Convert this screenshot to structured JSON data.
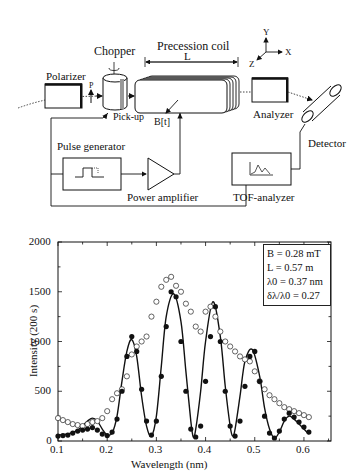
{
  "diagram": {
    "labels": {
      "polarizer": "Polarizer",
      "chopper": "Chopper",
      "precession_coil": "Precession coil",
      "length_L": "L",
      "p_label": "P",
      "pickup": "Pick-up",
      "field": "B[t]",
      "analyzer": "Analyzer",
      "detector": "Detector",
      "pulse_generator": "Pulse generator",
      "power_amplifier": "Power amplifier",
      "tof_analyzer": "TOF-analyzer",
      "axis_y": "Y",
      "axis_x": "X",
      "axis_z": "Z"
    }
  },
  "chart_data": {
    "type": "scatter",
    "title": "",
    "xlabel": "Wavelength (nm)",
    "ylabel": "Intensity (200 s)",
    "xlim": [
      0.1,
      0.655
    ],
    "ylim": [
      0,
      2000
    ],
    "xticks": [
      "0.1",
      "0.2",
      "0.3",
      "0.4",
      "0.5",
      "0.6"
    ],
    "yticks": [
      "0",
      "500",
      "1000",
      "1500",
      "2000"
    ],
    "grid": false,
    "annotation": {
      "lines": [
        "B = 0.28 mT",
        "L = 0.57 m",
        "λ0 = 0.37 nm",
        "δλ/λ0 = 0.27"
      ],
      "position": "upper right"
    },
    "series": [
      {
        "name": "filled circles (measured, with precession)",
        "marker": "filled-circle",
        "x": [
          0.1,
          0.11,
          0.12,
          0.13,
          0.14,
          0.15,
          0.16,
          0.17,
          0.18,
          0.19,
          0.2,
          0.21,
          0.22,
          0.23,
          0.24,
          0.25,
          0.26,
          0.27,
          0.28,
          0.29,
          0.3,
          0.31,
          0.32,
          0.33,
          0.34,
          0.35,
          0.36,
          0.37,
          0.38,
          0.39,
          0.4,
          0.41,
          0.42,
          0.43,
          0.44,
          0.45,
          0.46,
          0.47,
          0.48,
          0.49,
          0.5,
          0.51,
          0.52,
          0.53,
          0.54,
          0.55,
          0.56,
          0.57,
          0.58,
          0.59,
          0.6,
          0.61
        ],
        "y": [
          50,
          55,
          60,
          80,
          100,
          110,
          120,
          135,
          110,
          70,
          55,
          90,
          220,
          500,
          850,
          1050,
          900,
          520,
          200,
          60,
          200,
          650,
          1150,
          1500,
          1450,
          1000,
          500,
          120,
          40,
          150,
          600,
          1050,
          1350,
          1000,
          500,
          150,
          50,
          200,
          550,
          850,
          900,
          600,
          250,
          80,
          30,
          100,
          220,
          280,
          240,
          190,
          140,
          90
        ]
      },
      {
        "name": "open circles (measured, without precession)",
        "marker": "open-circle",
        "x": [
          0.1,
          0.11,
          0.12,
          0.13,
          0.14,
          0.15,
          0.16,
          0.17,
          0.18,
          0.19,
          0.2,
          0.21,
          0.22,
          0.23,
          0.24,
          0.25,
          0.26,
          0.27,
          0.28,
          0.29,
          0.3,
          0.31,
          0.32,
          0.33,
          0.34,
          0.35,
          0.36,
          0.37,
          0.38,
          0.39,
          0.4,
          0.41,
          0.42,
          0.43,
          0.44,
          0.45,
          0.46,
          0.47,
          0.48,
          0.49,
          0.5,
          0.51,
          0.52,
          0.53,
          0.54,
          0.55,
          0.56,
          0.57,
          0.58,
          0.59,
          0.6,
          0.61
        ],
        "y": [
          230,
          210,
          190,
          170,
          160,
          150,
          170,
          190,
          200,
          230,
          300,
          420,
          480,
          520,
          650,
          870,
          950,
          1000,
          1050,
          1250,
          1400,
          1550,
          1620,
          1650,
          1560,
          1500,
          1380,
          1300,
          1150,
          1100,
          1300,
          1350,
          1250,
          1100,
          1000,
          950,
          900,
          850,
          820,
          800,
          700,
          600,
          520,
          460,
          420,
          380,
          340,
          320,
          300,
          280,
          260,
          240
        ]
      },
      {
        "name": "fit (solid line)",
        "marker": "line",
        "x": [
          0.1,
          0.12,
          0.14,
          0.16,
          0.17,
          0.18,
          0.19,
          0.2,
          0.21,
          0.22,
          0.23,
          0.24,
          0.25,
          0.26,
          0.27,
          0.28,
          0.29,
          0.3,
          0.31,
          0.32,
          0.335,
          0.35,
          0.36,
          0.37,
          0.375,
          0.38,
          0.39,
          0.4,
          0.415,
          0.43,
          0.44,
          0.45,
          0.455,
          0.46,
          0.47,
          0.48,
          0.495,
          0.51,
          0.52,
          0.53,
          0.54,
          0.55,
          0.56,
          0.57,
          0.58,
          0.59,
          0.6,
          0.61
        ],
        "y": [
          60,
          70,
          110,
          200,
          230,
          200,
          120,
          60,
          80,
          250,
          600,
          900,
          1020,
          850,
          450,
          150,
          50,
          250,
          750,
          1250,
          1480,
          1200,
          700,
          200,
          40,
          120,
          500,
          1000,
          1400,
          1050,
          550,
          150,
          50,
          120,
          450,
          800,
          920,
          650,
          330,
          120,
          30,
          90,
          200,
          250,
          220,
          170,
          120,
          70
        ]
      }
    ]
  }
}
